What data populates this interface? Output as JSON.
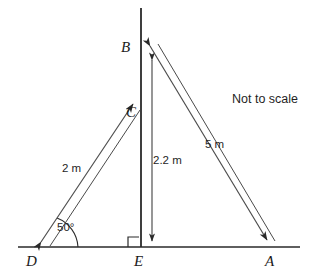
{
  "diagram": {
    "type": "geometry-figure",
    "annotation": "Not to scale",
    "stroke_color": "#2a2a2a",
    "background_color": "#ffffff",
    "vertices": [
      {
        "id": "B",
        "label": "B",
        "x": 141,
        "y": 48,
        "description": "top of vertical pole"
      },
      {
        "id": "C",
        "label": "C",
        "x": 141,
        "y": 113,
        "description": "point on pole where 2 m line meets"
      },
      {
        "id": "D",
        "label": "D",
        "x": 33,
        "y": 247,
        "description": "left point on ground line"
      },
      {
        "id": "E",
        "label": "E",
        "x": 141,
        "y": 247,
        "description": "foot of pole on ground line"
      },
      {
        "id": "A",
        "label": "A",
        "x": 272,
        "y": 247,
        "description": "right point on ground line"
      }
    ],
    "measurements": [
      {
        "id": "DC",
        "label": "2 m",
        "value": 2,
        "unit": "m",
        "from": "D",
        "to": "C",
        "arrow": "double"
      },
      {
        "id": "EB",
        "label": "2.2 m",
        "value": 2.2,
        "unit": "m",
        "from": "B",
        "to": "E",
        "arrow": "single-down"
      },
      {
        "id": "AB",
        "label": "5 m",
        "value": 5,
        "unit": "m",
        "from": "B",
        "to": "A",
        "arrow": "double"
      }
    ],
    "angles": [
      {
        "id": "angle-D",
        "label": "50°",
        "value": 50,
        "unit": "degrees",
        "at": "D",
        "between": [
          "D-A",
          "D-C"
        ]
      },
      {
        "id": "angle-E",
        "label": "",
        "value": 90,
        "unit": "degrees",
        "at": "E",
        "marker": "right-angle-square"
      }
    ],
    "lines": [
      {
        "id": "ground-line",
        "from_x": 18,
        "from_y": 247,
        "to_x": 300,
        "to_y": 247
      },
      {
        "id": "vertical-pole",
        "from_x": 141,
        "from_y": 8,
        "to_x": 141,
        "to_y": 247
      }
    ]
  }
}
